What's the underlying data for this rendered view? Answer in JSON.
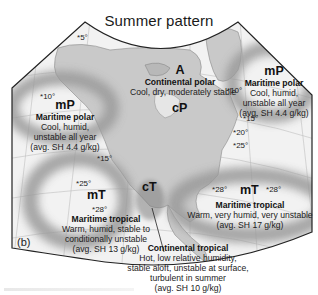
{
  "title": "Summer pattern",
  "panel_label": "(b)",
  "colors": {
    "land": "#c9c9c9",
    "ocean": "#f2f2f2",
    "source_region_shade": "#9e9e9e",
    "outline": "#222222"
  },
  "air_masses": [
    {
      "code": "A",
      "name": "Continental polar",
      "description": "Cool, dry, moderately stable"
    },
    {
      "code": "cP"
    },
    {
      "code": "mP",
      "name": "Maritime polar",
      "description_lines": [
        "Cool, humid,",
        "unstable all year",
        "(avg. SH 4.4 g/kg)"
      ],
      "region": "Pacific"
    },
    {
      "code": "mP",
      "name": "Maritime polar",
      "description_lines": [
        "Cool, humid,",
        "unstable all year",
        "(avg. SH 4.4 g/kg)"
      ],
      "region": "Atlantic"
    },
    {
      "code": "mT",
      "name": "Maritime tropical",
      "description_lines": [
        "Warm, humid, stable to",
        "conditionally unstable",
        "(avg. SH 13 g/kg)"
      ],
      "region": "Pacific"
    },
    {
      "code": "mT",
      "name": "Maritime tropical",
      "description_lines": [
        "Warm, very humid, very unstable",
        "(avg. SH 17 g/kg)"
      ],
      "region": "Atlantic"
    },
    {
      "code": "cT",
      "name": "Continental tropical",
      "description_lines": [
        "Hot, low relative humidity,",
        "stable aloft, unstable at surface,",
        "turbulent in summer",
        "(avg. SH 10 g/kg)"
      ]
    }
  ],
  "sea_surface_temps": [
    "5°",
    "10°",
    "10°",
    "15°",
    "15°",
    "20°",
    "25°",
    "25°",
    "28°",
    "28°",
    "28°"
  ]
}
